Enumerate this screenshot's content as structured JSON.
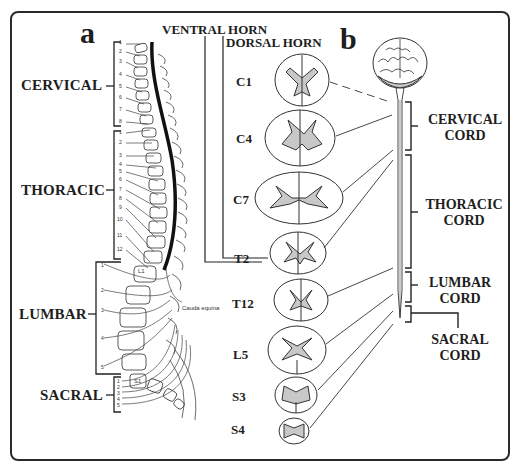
{
  "figure": {
    "panel_a": {
      "label": "a",
      "regions": [
        {
          "label": "CERVICAL",
          "vertebrae": [
            "1",
            "2",
            "3",
            "4",
            "5",
            "6",
            "7",
            "8"
          ]
        },
        {
          "label": "THORACIC",
          "vertebrae": [
            "1",
            "2",
            "3",
            "4",
            "5",
            "6",
            "7",
            "8",
            "9",
            "10",
            "11",
            "12"
          ]
        },
        {
          "label": "LUMBAR",
          "vertebrae": [
            "1",
            "2",
            "3",
            "4",
            "5"
          ]
        },
        {
          "label": "SACRAL",
          "vertebrae": [
            "1",
            "2",
            "3",
            "4",
            "5"
          ]
        }
      ],
      "annotations": {
        "l1": "L1",
        "s1": "S1",
        "cauda_equina": "Cauda equina"
      }
    },
    "panel_b": {
      "label": "b",
      "headers": {
        "ventral_horn": "VENTRAL HORN",
        "dorsal_horn": "DORSAL HORN"
      },
      "cross_sections": [
        "C1",
        "C4",
        "C7",
        "T2",
        "T12",
        "L5",
        "S3",
        "S4"
      ],
      "cord_regions": [
        {
          "line1": "CERVICAL",
          "line2": "CORD"
        },
        {
          "line1": "THORACIC",
          "line2": "CORD"
        },
        {
          "line1": "LUMBAR",
          "line2": "CORD"
        },
        {
          "line1": "SACRAL",
          "line2": "CORD"
        }
      ]
    },
    "colors": {
      "ink": "#1e1e1e",
      "gray_matter": "#c8c8c8",
      "background": "#ffffff"
    }
  }
}
